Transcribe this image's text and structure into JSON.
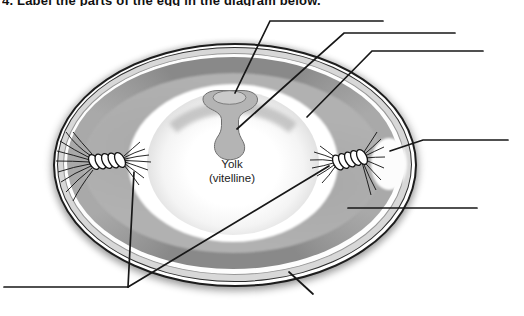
{
  "page": {
    "kind": "scanned worksheet diagram of an egg cross-section",
    "background": "#ffffff"
  },
  "caption": {
    "cropped_text": "4. Label the parts of the egg in the diagram below.",
    "note": "caption is cut off at top edge of scan; only letter bottoms visible"
  },
  "diagram": {
    "yolk_label_line1": "Yolk",
    "yolk_label_line2": "(vitelline)",
    "blank_label_count": 7,
    "blank_label_ids": [
      "blank-top-1",
      "blank-top-2",
      "blank-top-3",
      "blank-right-air-cell",
      "blank-right-albumen",
      "blank-bottom-left-chalazae",
      "pointer-bottom-shell"
    ],
    "icons": {
      "leader_line": "thin black pointer line",
      "blank_line": "horizontal answer line"
    },
    "colors": {
      "line": "#171717",
      "shell_line": "#1d1d1d",
      "membrane_ring": "#d8d8d8",
      "dense_albumen": "#898989",
      "albumen": "#b1b1b1",
      "inner_thin_albumen": "#ffffff",
      "yolk_center": "#ffffff",
      "yolk_edge": "#b2b2b2",
      "latebra": "#b4b4b4",
      "germinal_disc": "#cacaca",
      "air_cell": "#fcfcfc"
    }
  }
}
